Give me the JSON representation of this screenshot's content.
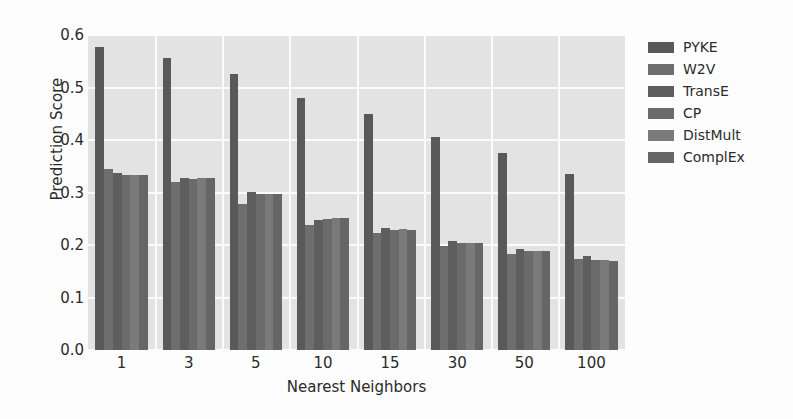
{
  "chart_data": {
    "type": "bar",
    "title": "",
    "xlabel": "Nearest Neighbors",
    "ylabel": "Prediction Score",
    "categories": [
      "1",
      "3",
      "5",
      "10",
      "15",
      "30",
      "50",
      "100"
    ],
    "ylim": [
      0.0,
      0.6
    ],
    "yticks": [
      "0.0",
      "0.1",
      "0.2",
      "0.3",
      "0.4",
      "0.5",
      "0.6"
    ],
    "ytick_values": [
      0.0,
      0.1,
      0.2,
      0.3,
      0.4,
      0.5,
      0.6
    ],
    "grid": true,
    "legend_position": "right",
    "series": [
      {
        "name": "PYKE",
        "color": "#595959",
        "values": [
          0.578,
          0.557,
          0.525,
          0.48,
          0.45,
          0.406,
          0.375,
          0.336
        ]
      },
      {
        "name": "W2V",
        "color": "#6e6e6e",
        "values": [
          0.345,
          0.32,
          0.278,
          0.238,
          0.222,
          0.198,
          0.183,
          0.173
        ]
      },
      {
        "name": "TransE",
        "color": "#5e5e5e",
        "values": [
          0.338,
          0.328,
          0.301,
          0.248,
          0.232,
          0.208,
          0.192,
          0.18
        ]
      },
      {
        "name": "CP",
        "color": "#6b6b6b",
        "values": [
          0.333,
          0.326,
          0.297,
          0.25,
          0.228,
          0.203,
          0.188,
          0.172
        ]
      },
      {
        "name": "DistMult",
        "color": "#7a7a7a",
        "values": [
          0.333,
          0.327,
          0.298,
          0.252,
          0.23,
          0.204,
          0.189,
          0.171
        ]
      },
      {
        "name": "ComplEx",
        "color": "#666666",
        "values": [
          0.333,
          0.327,
          0.298,
          0.251,
          0.229,
          0.203,
          0.188,
          0.17
        ]
      }
    ]
  },
  "legend": {
    "items": [
      {
        "label": "PYKE",
        "color": "#595959"
      },
      {
        "label": "W2V",
        "color": "#6e6e6e"
      },
      {
        "label": "TransE",
        "color": "#5e5e5e"
      },
      {
        "label": "CP",
        "color": "#6b6b6b"
      },
      {
        "label": "DistMult",
        "color": "#7a7a7a"
      },
      {
        "label": "ComplEx",
        "color": "#666666"
      }
    ]
  },
  "axes": {
    "x_title": "Nearest Neighbors",
    "y_title": "Prediction Score"
  },
  "style": {
    "plot_background": "#e3e3e3",
    "grid_color": "#fbfbfb",
    "text_color": "#2b2b2b"
  }
}
